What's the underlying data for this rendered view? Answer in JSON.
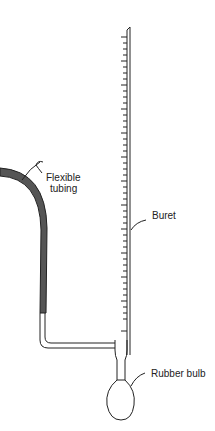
{
  "diagram": {
    "labels": {
      "flexible_tubing_line1": "Flexible",
      "flexible_tubing_line2": "tubing",
      "buret": "Buret",
      "rubber_bulb": "Rubber bulb"
    },
    "colors": {
      "ink": "#222222",
      "tubing_fill": "#555555"
    }
  }
}
